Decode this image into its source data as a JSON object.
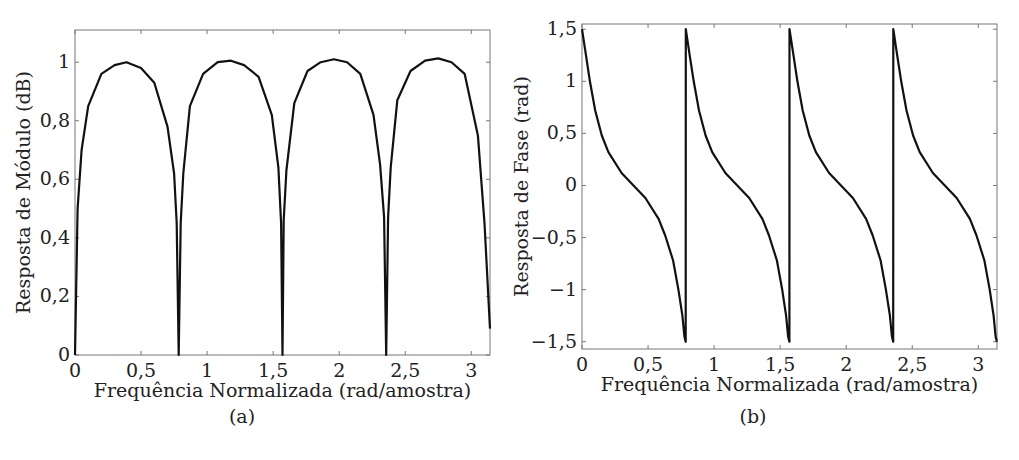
{
  "chart_data": [
    {
      "id": "a",
      "type": "line",
      "title": "",
      "panel_label": "(a)",
      "xlabel": "Frequência Normalizada (rad/amostra)",
      "ylabel": "Resposta de Módulo (dB)",
      "xlim": [
        0,
        3.1416
      ],
      "ylim": [
        0,
        1.11
      ],
      "xticks": [
        0,
        0.5,
        1,
        1.5,
        2,
        2.5,
        3
      ],
      "xtick_labels": [
        "0",
        "0,5",
        "1",
        "1,5",
        "2",
        "2,5",
        "3"
      ],
      "yticks": [
        0,
        0.2,
        0.4,
        0.6,
        0.8,
        1
      ],
      "ytick_labels": [
        "0",
        "0,2",
        "0,4",
        "0,6",
        "0,8",
        "1"
      ],
      "grid": false,
      "legend": null,
      "series": [
        {
          "name": "magnitude",
          "color": "#111111",
          "nulls_at": [
            0,
            0.785,
            1.571,
            2.356
          ],
          "peaks": [
            {
              "x": 0.39,
              "y": 1.0
            },
            {
              "x": 1.18,
              "y": 1.005
            },
            {
              "x": 1.96,
              "y": 1.01
            },
            {
              "x": 2.75,
              "y": 1.013
            }
          ],
          "x": [
            0,
            0.02,
            0.05,
            0.1,
            0.2,
            0.3,
            0.39,
            0.5,
            0.6,
            0.7,
            0.75,
            0.77,
            0.785,
            0.8,
            0.82,
            0.87,
            0.97,
            1.08,
            1.18,
            1.28,
            1.39,
            1.49,
            1.54,
            1.56,
            1.571,
            1.58,
            1.6,
            1.66,
            1.76,
            1.86,
            1.96,
            2.06,
            2.16,
            2.26,
            2.31,
            2.34,
            2.356,
            2.37,
            2.39,
            2.44,
            2.54,
            2.65,
            2.75,
            2.85,
            2.95,
            3.05,
            3.1,
            3.1416
          ],
          "y": [
            0,
            0.5,
            0.7,
            0.85,
            0.96,
            0.99,
            1.0,
            0.98,
            0.93,
            0.78,
            0.62,
            0.45,
            0,
            0.45,
            0.62,
            0.85,
            0.96,
            1.0,
            1.005,
            0.99,
            0.95,
            0.82,
            0.64,
            0.45,
            0,
            0.46,
            0.63,
            0.86,
            0.97,
            1.0,
            1.01,
            1.0,
            0.96,
            0.82,
            0.65,
            0.47,
            0,
            0.47,
            0.64,
            0.87,
            0.97,
            1.005,
            1.013,
            1.0,
            0.96,
            0.75,
            0.45,
            0.09
          ]
        }
      ]
    },
    {
      "id": "b",
      "type": "line",
      "title": "",
      "panel_label": "(b)",
      "xlabel": "Frequência Normalizada (rad/amostra)",
      "ylabel": "Resposta de Fase (rad)",
      "xlim": [
        0,
        3.1416
      ],
      "ylim": [
        -1.57,
        1.55
      ],
      "xticks": [
        0,
        0.5,
        1,
        1.5,
        2,
        2.5,
        3
      ],
      "xtick_labels": [
        "0",
        "0,5",
        "1",
        "1,5",
        "2",
        "2,5",
        "3"
      ],
      "yticks": [
        -1.5,
        -1,
        -0.5,
        0,
        0.5,
        1,
        1.5
      ],
      "ytick_labels": [
        "−1,5",
        "−1",
        "−0,5",
        "0",
        "0,5",
        "1",
        "1,5"
      ],
      "grid": false,
      "legend": null,
      "series": [
        {
          "name": "phase",
          "color": "#111111",
          "discontinuities_at": [
            0.785,
            1.571,
            2.356
          ],
          "x": [
            0,
            0.03,
            0.06,
            0.1,
            0.15,
            0.2,
            0.3,
            0.39,
            0.48,
            0.58,
            0.63,
            0.69,
            0.73,
            0.76,
            0.775,
            0.785
          ],
          "y": [
            1.5,
            1.25,
            1.0,
            0.72,
            0.48,
            0.32,
            0.12,
            0.0,
            -0.12,
            -0.32,
            -0.48,
            -0.72,
            -1.0,
            -1.25,
            -1.45,
            -1.5
          ],
          "period": 0.7854,
          "periods": 4
        }
      ]
    }
  ],
  "figure": {
    "panels": [
      {
        "label": "(a)"
      },
      {
        "label": "(b)"
      }
    ]
  }
}
